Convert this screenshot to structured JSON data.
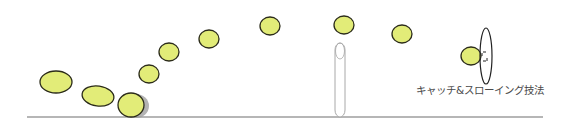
{
  "diagram": {
    "caption": "キャッチ&スローイング技法",
    "colors": {
      "ball_fill": "#e2ec78",
      "ball_stroke": "#2b2b1a",
      "shadow": "#9a9a9a",
      "ground": "#6e6e6e",
      "pole_stroke": "#a8a8a8",
      "racket_stroke": "#222222",
      "background": "#ffffff"
    },
    "ground": {
      "x1": 27,
      "y1": 117,
      "x2": 543,
      "y2": 117
    },
    "balls": [
      {
        "cx": 56,
        "cy": 82,
        "rx": 16,
        "ry": 11,
        "rot": 0
      },
      {
        "cx": 98,
        "cy": 96,
        "rx": 16,
        "ry": 10,
        "rot": 8
      },
      {
        "cx": 131,
        "cy": 105,
        "rx": 13,
        "ry": 12,
        "rot": 0,
        "shadow": true
      },
      {
        "cx": 149,
        "cy": 74,
        "rx": 10,
        "ry": 9,
        "rot": 0
      },
      {
        "cx": 169,
        "cy": 52,
        "rx": 10,
        "ry": 9,
        "rot": 0
      },
      {
        "cx": 209,
        "cy": 39,
        "rx": 10,
        "ry": 9,
        "rot": 0
      },
      {
        "cx": 270,
        "cy": 26,
        "rx": 10,
        "ry": 9,
        "rot": 0
      },
      {
        "cx": 344,
        "cy": 25,
        "rx": 10,
        "ry": 9,
        "rot": 0
      },
      {
        "cx": 402,
        "cy": 34,
        "rx": 10,
        "ry": 9,
        "rot": 0
      },
      {
        "cx": 471,
        "cy": 56,
        "rx": 10,
        "ry": 9,
        "rot": 0
      }
    ],
    "pole": {
      "cx": 340,
      "top": 43,
      "bottom": 117,
      "rx": 5
    },
    "racket": {
      "cx": 486,
      "cy": 56,
      "rx": 6,
      "ry": 28
    }
  }
}
